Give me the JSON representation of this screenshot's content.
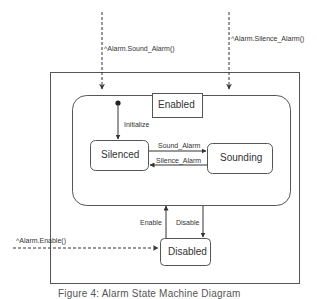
{
  "diagram": {
    "type": "uml-state-machine",
    "outer_container": {},
    "composite_state": {
      "name": "Enabled"
    },
    "states": [
      {
        "id": "silenced",
        "label": "Silenced"
      },
      {
        "id": "sounding",
        "label": "Sounding"
      },
      {
        "id": "disabled",
        "label": "Disabled"
      }
    ],
    "initial_transition": {
      "label": "Initialize",
      "target": "Silenced"
    },
    "transitions": [
      {
        "from": "Silenced",
        "to": "Sounding",
        "label": "Sound_Alarm"
      },
      {
        "from": "Sounding",
        "to": "Silenced",
        "label": "Silence_Alarm"
      },
      {
        "from": "Disabled",
        "to": "Enabled",
        "label": "Enable"
      },
      {
        "from": "Enabled",
        "to": "Disabled",
        "label": "Disable"
      }
    ],
    "external_events": [
      {
        "label": "^Alarm.Sound_Alarm()",
        "target": "Enabled",
        "style": "dashed"
      },
      {
        "label": "^Alarm.Silence_Alarm()",
        "target": "Enabled",
        "style": "dashed"
      },
      {
        "label": "^Alarm.Enable()",
        "target": "Disabled",
        "style": "dashed"
      }
    ],
    "caption": "Figure 4: Alarm State Machine Diagram",
    "colors": {
      "line": "#333333",
      "text": "#333333",
      "background": "#ffffff"
    }
  }
}
